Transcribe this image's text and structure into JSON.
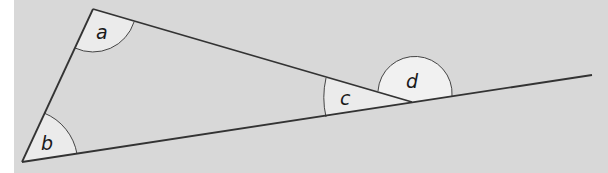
{
  "figure": {
    "background_color": "#d8d8d8",
    "line_color": "#333333",
    "angle_fill": "#ebebeb",
    "vertices": {
      "top": [
        93,
        9
      ],
      "bottom_left": [
        22,
        162
      ],
      "right": [
        412,
        102
      ],
      "extension_end": [
        592,
        75
      ]
    },
    "angles": [
      {
        "id": "a",
        "label": "a",
        "vertex": "top",
        "type": "interior"
      },
      {
        "id": "b",
        "label": "b",
        "vertex": "bottom_left",
        "type": "interior"
      },
      {
        "id": "c",
        "label": "c",
        "vertex": "right",
        "type": "interior"
      },
      {
        "id": "d",
        "label": "d",
        "vertex": "right",
        "type": "exterior"
      }
    ]
  }
}
